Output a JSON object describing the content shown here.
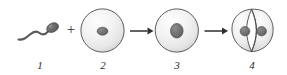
{
  "figure": {
    "background_color": "#ffffff",
    "outline_color": "#4a4a4a",
    "cell_fill_light": "#f4f4f4",
    "cell_fill_shadow": "#c9c9c9",
    "nucleus_color": "#6e6e6e",
    "nucleus_outline": "#4a4a4a",
    "arrow_color": "#2e2e2e",
    "sperm_color": "#5a5a5a",
    "plus_sign": "+"
  },
  "stages": [
    {
      "id": "stage-1",
      "label": "1",
      "name": "sperm-cell",
      "description": "Sperm with oval head and wavy flagellum"
    },
    {
      "id": "stage-2",
      "label": "2",
      "name": "egg-cell",
      "description": "Egg cell with small central nucleus"
    },
    {
      "id": "stage-3",
      "label": "3",
      "name": "zygote-cell",
      "description": "Zygote with enlarged fused nucleus"
    },
    {
      "id": "stage-4",
      "label": "4",
      "name": "dividing-cell",
      "description": "Dividing cell with cleavage furrow and two nuclei"
    }
  ],
  "arrows": [
    {
      "id": "arrow-1",
      "from": "stage-2",
      "to": "stage-3"
    },
    {
      "id": "arrow-2",
      "from": "stage-3",
      "to": "stage-4"
    }
  ]
}
